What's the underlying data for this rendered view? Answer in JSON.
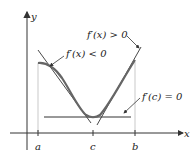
{
  "figure": {
    "axes": {
      "x_label": "x",
      "y_label": "y"
    },
    "ticks": [
      {
        "label": "a",
        "x": 38
      },
      {
        "label": "c",
        "x": 93
      },
      {
        "label": "b",
        "x": 135
      }
    ],
    "annotations": {
      "decreasing": "f′(x) < 0",
      "increasing": "f′(x) > 0",
      "critical": "f′(c) = 0"
    },
    "colors": {
      "curve": "#555555",
      "axis": "#333333",
      "guide": "#bbbbbb"
    }
  }
}
